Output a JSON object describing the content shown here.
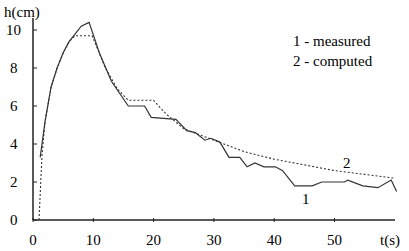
{
  "chart_data": {
    "type": "line",
    "title": "",
    "xlabel": "t(s)",
    "ylabel": "h(cm)",
    "xlim": [
      0,
      60
    ],
    "ylim": [
      0,
      10.5
    ],
    "x_ticks": [
      0,
      10,
      20,
      30,
      40,
      50
    ],
    "y_ticks": [
      0,
      2,
      4,
      6,
      8,
      10
    ],
    "grid": false,
    "legend_position": "top-right",
    "legend": [
      "1 - measured",
      "2 - computed"
    ],
    "series": [
      {
        "name": "1 - measured",
        "label": "1",
        "style": "solid",
        "x": [
          1.2,
          2,
          3,
          4,
          5,
          6,
          7,
          8,
          9.3,
          11,
          13,
          15.8,
          18.5,
          19.6,
          23.7,
          25.5,
          26.9,
          28.5,
          29.5,
          31,
          32.5,
          34.3,
          35.5,
          36.8,
          38.3,
          40.2,
          41.4,
          43.4,
          46.3,
          47.9,
          51.7,
          52.2,
          54.7,
          57.2,
          59.4,
          60.3
        ],
        "y": [
          3.3,
          5.2,
          7.0,
          8.0,
          8.8,
          9.4,
          9.8,
          10.2,
          10.4,
          8.8,
          7.3,
          6.0,
          6.0,
          5.4,
          5.3,
          4.7,
          4.6,
          4.2,
          4.3,
          4.1,
          3.3,
          3.3,
          2.8,
          3.0,
          2.8,
          2.8,
          2.6,
          1.8,
          1.8,
          2.0,
          2.0,
          2.1,
          1.8,
          1.7,
          2.1,
          1.5
        ]
      },
      {
        "name": "2 - computed",
        "label": "2",
        "style": "dashed",
        "x": [
          1,
          1.5,
          2,
          3,
          4,
          5,
          6,
          7,
          9.8,
          12,
          14,
          15.8,
          20,
          22,
          25,
          30,
          35,
          40,
          45,
          50,
          55,
          60
        ],
        "y": [
          0,
          3.4,
          5.2,
          7.0,
          8.0,
          8.8,
          9.4,
          9.7,
          9.7,
          8.0,
          6.9,
          6.3,
          6.3,
          5.6,
          4.8,
          4.2,
          3.6,
          3.2,
          2.9,
          2.6,
          2.4,
          2.2
        ]
      }
    ]
  },
  "legend": {
    "item1": "1 - measured",
    "item2": "2 - computed"
  },
  "axes": {
    "y_title": "h(cm)",
    "x_title": "t(s)"
  },
  "curve_labels": {
    "measured": "1",
    "computed": "2"
  }
}
